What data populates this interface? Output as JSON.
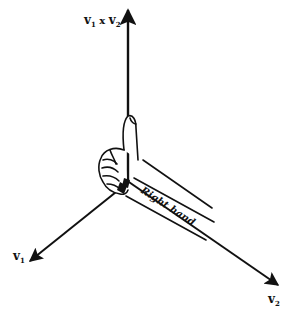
{
  "diagram": {
    "colors": {
      "ink": "#111111",
      "background": "#ffffff"
    },
    "origin": {
      "x": 128,
      "y": 182
    },
    "vectors": [
      {
        "id": "v1",
        "label": "v",
        "subscript": "1",
        "tip": {
          "x": 28,
          "y": 262
        }
      },
      {
        "id": "v2",
        "label": "v",
        "subscript": "2",
        "tip": {
          "x": 280,
          "y": 286
        }
      },
      {
        "id": "v1xv2",
        "label": "v",
        "subscript": "1",
        "operator": " x ",
        "label2": "v",
        "subscript2": "2",
        "tip": {
          "x": 128,
          "y": 8
        }
      }
    ],
    "labels": {
      "v1": {
        "base": "v",
        "sub": "1"
      },
      "v2": {
        "base": "v",
        "sub": "2"
      },
      "cross": {
        "base1": "v",
        "sub1": "1",
        "op": " x ",
        "base2": "v",
        "sub2": "2"
      },
      "hand": "Right hand"
    }
  }
}
